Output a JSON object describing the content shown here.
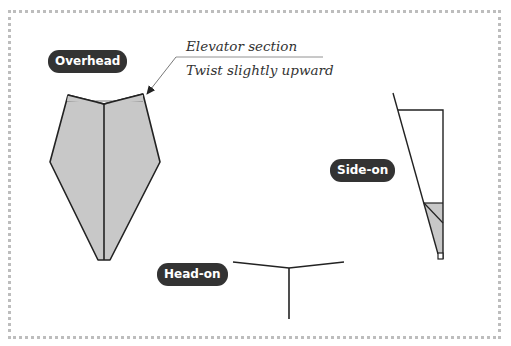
{
  "views": {
    "overhead": {
      "label": "Overhead"
    },
    "side_on": {
      "label": "Side-on"
    },
    "head_on": {
      "label": "Head-on"
    }
  },
  "annotation": {
    "title": "Elevator section",
    "note": "Twist slightly upward"
  },
  "colors": {
    "label_bg": "#333333",
    "label_text": "#ffffff",
    "paper_fill": "#c8c8c8",
    "line": "#222222",
    "frame": "#bdbdbd"
  }
}
